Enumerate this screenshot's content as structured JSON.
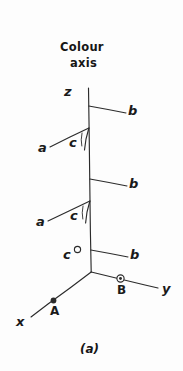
{
  "figure": {
    "title": {
      "line1": "Colour",
      "line2": "axis"
    },
    "caption": "(a)",
    "ink_color": "#2b2b2b",
    "text_color": "#161616",
    "background_color": "#fdfdfd",
    "axes": [
      {
        "name": "z-axis",
        "label": "z"
      },
      {
        "name": "y-axis",
        "label": "y"
      },
      {
        "name": "x-axis",
        "label": "x"
      }
    ],
    "branch_labels": {
      "b_top": "b",
      "b_middle": "b",
      "b_bottom": "b",
      "a_upper": "a",
      "a_lower": "a",
      "c_upper": "c",
      "c_lower": "c",
      "c_origin": "c"
    },
    "points": [
      {
        "name": "point-A",
        "label": "A",
        "marker": "filled-dot"
      },
      {
        "name": "point-B",
        "label": "B",
        "marker": "circled-dot"
      },
      {
        "name": "point-C",
        "label": "c",
        "marker": "open-circle"
      }
    ]
  }
}
